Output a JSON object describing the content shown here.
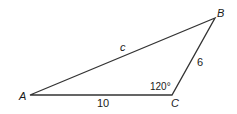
{
  "diagram": {
    "type": "triangle",
    "vertices": {
      "A": {
        "label": "A",
        "x": 30,
        "y": 95
      },
      "B": {
        "label": "B",
        "x": 215,
        "y": 18
      },
      "C": {
        "label": "C",
        "x": 172,
        "y": 95
      }
    },
    "sides": {
      "AB": {
        "label": "c"
      },
      "AC": {
        "label": "10"
      },
      "BC": {
        "label": "6"
      }
    },
    "angles": {
      "C": {
        "label": "120°"
      }
    },
    "stroke_color": "#333333"
  }
}
